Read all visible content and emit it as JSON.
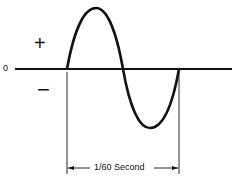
{
  "diagram": {
    "axis_zero_label": "0",
    "positive_label": "+",
    "negative_label": "−",
    "period_label": "1/60 Second",
    "colors": {
      "stroke": "#111111",
      "background": "#ffffff"
    }
  }
}
